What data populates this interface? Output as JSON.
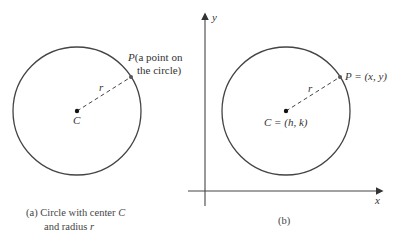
{
  "panel_a": {
    "caption_line1_prefix": "(a)  Circle with center ",
    "caption_line1_var": "C",
    "caption_line2_prefix": "and radius ",
    "caption_line2_var": "r",
    "center_label": "C",
    "radius_label": "r",
    "point_label_var": "P",
    "point_label_line1": "(a point on",
    "point_label_line2": "the circle)"
  },
  "panel_b": {
    "caption": "(b)",
    "center_label": "C = (h, k)",
    "radius_label": "r",
    "point_label": "P = (x, y)",
    "x_axis_label": "x",
    "y_axis_label": "y"
  },
  "colors": {
    "stroke": "#444444",
    "text": "#333333"
  }
}
